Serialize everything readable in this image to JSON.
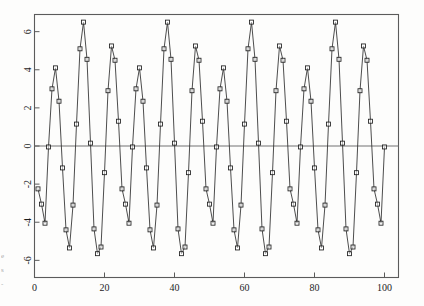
{
  "figure": {
    "background_color": "#fdfdfc",
    "frame_color": "#5b5b5b",
    "line_color": "#2d2d2d",
    "marker_color": "#1f1f1f",
    "zero_line_color": "#737373"
  },
  "scan_artifacts": {
    "note": "faint partial glyphs bleeding in from the page edge",
    "glyphs": [
      "e",
      "s",
      "-"
    ]
  },
  "chart_data": {
    "type": "line",
    "title": "",
    "subtitle": "",
    "xlabel": "",
    "ylabel": "",
    "xlim": [
      0,
      104
    ],
    "ylim": [
      -6.9,
      6.9
    ],
    "xticks": [
      0,
      20,
      40,
      60,
      80,
      100
    ],
    "xticklabels": [
      "0",
      "20",
      "40",
      "60",
      "80",
      "100"
    ],
    "yticks": [
      -6,
      -4,
      -2,
      0,
      2,
      4,
      6
    ],
    "yticklabels": [
      "-6",
      "-4",
      "-2",
      "0",
      "2",
      "4",
      "6"
    ],
    "ytick_label_rotation": 90,
    "grid": false,
    "legend": null,
    "marker": "open-square",
    "marker_size": 4,
    "series": [
      {
        "name": "signal",
        "x": [
          1,
          2,
          3,
          4,
          5,
          6,
          7,
          8,
          9,
          10,
          11,
          12,
          13,
          14,
          15,
          16,
          17,
          18,
          19,
          20,
          21,
          22,
          23,
          24,
          25,
          26,
          27,
          28,
          29,
          30,
          31,
          32,
          33,
          34,
          35,
          36,
          37,
          38,
          39,
          40,
          41,
          42,
          43,
          44,
          45,
          46,
          47,
          48,
          49,
          50,
          51,
          52,
          53,
          54,
          55,
          56,
          57,
          58,
          59,
          60,
          61,
          62,
          63,
          64,
          65,
          66,
          67,
          68,
          69,
          70,
          71,
          72,
          73,
          74,
          75,
          76,
          77,
          78,
          79,
          80,
          81,
          82,
          83,
          84,
          85,
          86,
          87,
          88,
          89,
          90,
          91,
          92,
          93,
          94,
          95,
          96,
          97,
          98,
          99,
          100
        ],
        "y": [
          -2.25,
          -3.05,
          -4.05,
          -0.05,
          3.0,
          4.1,
          2.35,
          -1.15,
          -4.4,
          -5.35,
          -3.1,
          1.15,
          5.1,
          6.5,
          4.55,
          0.15,
          -4.35,
          -5.65,
          -5.3,
          -1.4,
          2.9,
          5.25,
          4.5,
          1.3,
          -2.25,
          -3.05,
          -4.05,
          -0.05,
          3.0,
          4.1,
          2.35,
          -1.15,
          -4.4,
          -5.35,
          -3.1,
          1.15,
          5.1,
          6.5,
          4.55,
          0.15,
          -4.35,
          -5.65,
          -5.3,
          -1.4,
          2.9,
          5.25,
          4.5,
          1.3,
          -2.25,
          -3.05,
          -4.05,
          -0.05,
          3.0,
          4.1,
          2.35,
          -1.15,
          -4.4,
          -5.35,
          -3.1,
          1.15,
          5.1,
          6.5,
          4.55,
          0.15,
          -4.35,
          -5.65,
          -5.3,
          -1.4,
          2.9,
          5.25,
          4.5,
          1.3,
          -2.25,
          -3.05,
          -4.05,
          -0.05,
          3.0,
          4.1,
          2.35,
          -1.15,
          -4.4,
          -5.35,
          -3.1,
          1.15,
          5.1,
          6.5,
          4.55,
          0.15,
          -4.35,
          -5.65,
          -5.3,
          -1.4,
          2.9,
          5.25,
          4.5,
          1.3,
          -2.25,
          -3.05,
          -4.05,
          -0.05
        ]
      }
    ]
  }
}
